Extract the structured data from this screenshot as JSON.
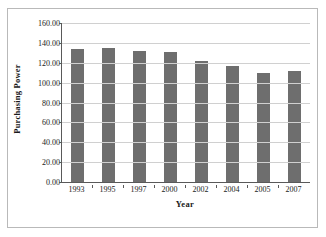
{
  "chart_data": {
    "type": "bar",
    "title": "",
    "xlabel": "Year",
    "ylabel": "Purchasing Power",
    "categories": [
      "1993",
      "1995",
      "1997",
      "2000",
      "2002",
      "2004",
      "2005",
      "2007"
    ],
    "values": [
      134.0,
      135.0,
      132.0,
      131.0,
      122.0,
      117.0,
      110.0,
      112.0
    ],
    "ylim": [
      0,
      160
    ],
    "ytick_step": 20,
    "ytick_labels": [
      "160.00",
      "140.00",
      "120.00",
      "100.00",
      "80.00",
      "60.00",
      "40.00",
      "20.00",
      "0.00"
    ],
    "ytick_values": [
      160,
      140,
      120,
      100,
      80,
      60,
      40,
      20,
      0
    ],
    "grid": true,
    "legend": false,
    "legend_position": "none",
    "bar_color": "#6e6e6e",
    "grid_color": "#d0d0d0",
    "axis_color": "#595959",
    "frame_color": "#b9b9b9"
  }
}
